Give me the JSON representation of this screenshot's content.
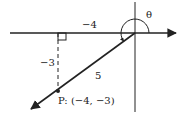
{
  "diagram": {
    "type": "reference-angle-diagram",
    "labels": {
      "horizontal_leg": "−4",
      "vertical_leg": "−3",
      "hypotenuse": "5",
      "point": "P: (−4, −3)",
      "angle": "θ"
    },
    "point": {
      "x": -4,
      "y": -3
    },
    "colors": {
      "stroke": "#222222",
      "background": "#ffffff"
    }
  }
}
